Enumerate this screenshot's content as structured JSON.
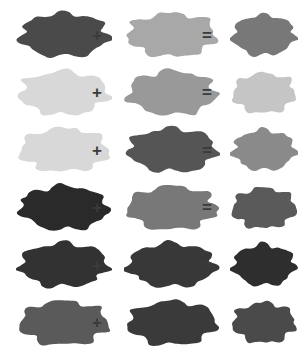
{
  "figure": {
    "type": "color-mixing-equations",
    "background_color": "#ffffff",
    "width": 301,
    "height": 352,
    "operator_color": "#3b3b3b",
    "shape_name": "irregular-cloud-splat",
    "operators": {
      "plus": "+",
      "equals": "="
    },
    "rows": [
      {
        "index": 1,
        "operand_a_color": "#4a4a4a",
        "operand_b_color": "#a8a8a8",
        "result_color": "#787878",
        "plus": "+",
        "equals": "="
      },
      {
        "index": 2,
        "operand_a_color": "#d8d8d8",
        "operand_b_color": "#999999",
        "result_color": "#c5c5c5",
        "plus": "+",
        "equals": "="
      },
      {
        "index": 3,
        "operand_a_color": "#d8d8d8",
        "operand_b_color": "#555555",
        "result_color": "#8a8a8a",
        "plus": "+",
        "equals": "="
      },
      {
        "index": 4,
        "operand_a_color": "#2a2a2a",
        "operand_b_color": "#787878",
        "result_color": "#5a5a5a",
        "plus": "+",
        "equals": "="
      },
      {
        "index": 5,
        "operand_a_color": "#323232",
        "operand_b_color": "#383838",
        "result_color": "#2e2e2e",
        "plus": "+",
        "equals": "="
      },
      {
        "index": 6,
        "operand_a_color": "#5a5a5a",
        "operand_b_color": "#3a3a3a",
        "result_color": "#4a4a4a",
        "plus": "+",
        "equals": "="
      }
    ]
  }
}
